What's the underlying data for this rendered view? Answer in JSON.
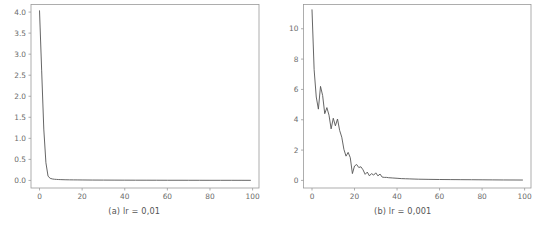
{
  "figure": {
    "background_color": "#ffffff",
    "line_color": "#555555",
    "axis_color": "#9a9a9a",
    "tick_label_color": "#6b6b6b"
  },
  "chart_data": [
    {
      "type": "line",
      "title": "",
      "caption": "(a) lr = 0,01",
      "xlabel": "",
      "ylabel": "",
      "xlim": [
        -4,
        103
      ],
      "ylim": [
        -0.18,
        4.18
      ],
      "xticks": [
        0,
        20,
        40,
        60,
        80,
        100
      ],
      "yticks": [
        0.0,
        0.5,
        1.0,
        1.5,
        2.0,
        2.5,
        3.0,
        3.5,
        4.0
      ],
      "xtick_labels": [
        "0",
        "20",
        "40",
        "60",
        "80",
        "100"
      ],
      "ytick_labels": [
        "0.0",
        "0.5",
        "1.0",
        "1.5",
        "2.0",
        "2.5",
        "3.0",
        "3.5",
        "4.0"
      ],
      "grid": false,
      "legend": "none",
      "series": [
        {
          "name": "loss",
          "x": [
            0,
            1,
            2,
            3,
            4,
            5,
            6,
            7,
            8,
            9,
            10,
            12,
            14,
            16,
            18,
            20,
            25,
            30,
            35,
            40,
            45,
            50,
            55,
            60,
            65,
            70,
            75,
            80,
            85,
            90,
            95,
            99
          ],
          "values": [
            4.03,
            2.62,
            1.22,
            0.42,
            0.1,
            0.05,
            0.035,
            0.028,
            0.024,
            0.021,
            0.019,
            0.016,
            0.014,
            0.013,
            0.012,
            0.011,
            0.009,
            0.008,
            0.007,
            0.006,
            0.0055,
            0.005,
            0.0045,
            0.004,
            0.0038,
            0.0035,
            0.0032,
            0.003,
            0.0028,
            0.0026,
            0.0024,
            0.0022
          ]
        }
      ]
    },
    {
      "type": "line",
      "title": "",
      "caption": "(b) lr = 0,001",
      "xlabel": "",
      "ylabel": "",
      "xlim": [
        -4,
        103
      ],
      "ylim": [
        -0.5,
        11.6
      ],
      "xticks": [
        0,
        20,
        40,
        60,
        80,
        100
      ],
      "yticks": [
        0,
        2,
        4,
        6,
        8,
        10
      ],
      "xtick_labels": [
        "0",
        "20",
        "40",
        "60",
        "80",
        "100"
      ],
      "ytick_labels": [
        "0",
        "2",
        "4",
        "6",
        "8",
        "10"
      ],
      "grid": false,
      "legend": "none",
      "series": [
        {
          "name": "loss",
          "x": [
            0,
            1,
            2,
            3,
            4,
            5,
            6,
            7,
            8,
            9,
            10,
            11,
            12,
            13,
            14,
            15,
            16,
            17,
            18,
            19,
            20,
            21,
            22,
            23,
            24,
            25,
            26,
            27,
            28,
            29,
            30,
            31,
            32,
            33,
            34,
            35,
            36,
            38,
            40,
            42,
            44,
            46,
            48,
            50,
            55,
            60,
            65,
            70,
            75,
            80,
            85,
            90,
            95,
            99
          ],
          "values": [
            11.25,
            7.3,
            5.5,
            4.7,
            6.2,
            5.6,
            4.4,
            4.8,
            4.3,
            3.4,
            4.1,
            3.6,
            4.05,
            3.3,
            2.85,
            2.05,
            1.6,
            1.85,
            1.5,
            0.45,
            0.95,
            1.05,
            0.85,
            0.9,
            0.7,
            0.4,
            0.55,
            0.3,
            0.45,
            0.35,
            0.5,
            0.3,
            0.42,
            0.22,
            0.2,
            0.2,
            0.18,
            0.16,
            0.14,
            0.12,
            0.11,
            0.1,
            0.09,
            0.08,
            0.07,
            0.06,
            0.055,
            0.05,
            0.045,
            0.04,
            0.035,
            0.03,
            0.028,
            0.025
          ]
        }
      ]
    }
  ]
}
